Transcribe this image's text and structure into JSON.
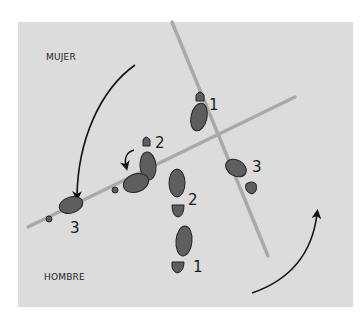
{
  "labels": {
    "woman": "MUJER",
    "man": "HOMBRE"
  },
  "step_numbers": {
    "woman_1": "1",
    "woman_2": "2",
    "woman_3": "3",
    "man_1": "1",
    "man_2": "2",
    "man_3": "3"
  },
  "colors": {
    "background": "#dcdcdc",
    "footprint": "#5e5e5e",
    "line": "#a9a9a9",
    "arrow": "#111111"
  }
}
